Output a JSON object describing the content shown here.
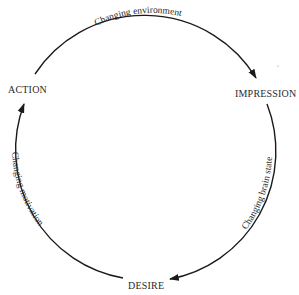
{
  "diagram": {
    "type": "cycle",
    "nodes": [
      {
        "id": "action",
        "label": "ACTION"
      },
      {
        "id": "impression",
        "label": "IMPRESSION"
      },
      {
        "id": "desire",
        "label": "DESIRE"
      }
    ],
    "edges": [
      {
        "from": "action",
        "to": "impression",
        "label": "Changing  environment"
      },
      {
        "from": "impression",
        "to": "desire",
        "label": "Changing brain state"
      },
      {
        "from": "desire",
        "to": "action",
        "label": "Changing motivation"
      }
    ]
  },
  "colors": {
    "line": "#1a1a1a",
    "text": "#2a2a2a",
    "background": "#ffffff"
  }
}
